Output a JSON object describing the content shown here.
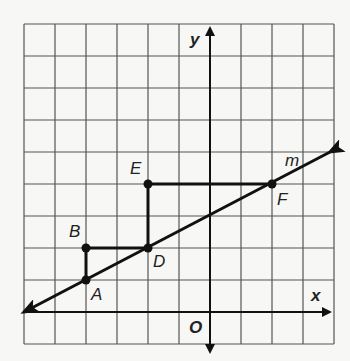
{
  "diagram": {
    "type": "coordinate-grid",
    "grid": {
      "cols": 10,
      "rows": 10,
      "origin_col": 6,
      "origin_row": 9
    },
    "axes": {
      "x_label": "x",
      "y_label": "y",
      "origin_label": "O"
    },
    "line": {
      "label": "m",
      "slope": 0.5,
      "through": [
        "A",
        "D",
        "F"
      ]
    },
    "points": [
      {
        "name": "A",
        "x": -4,
        "y": 1
      },
      {
        "name": "B",
        "x": -4,
        "y": 2
      },
      {
        "name": "D",
        "x": -2,
        "y": 2
      },
      {
        "name": "E",
        "x": -2,
        "y": 4
      },
      {
        "name": "F",
        "x": 2,
        "y": 4
      }
    ],
    "segments": [
      [
        "A",
        "B"
      ],
      [
        "B",
        "D"
      ],
      [
        "D",
        "E"
      ],
      [
        "E",
        "F"
      ]
    ],
    "colors": {
      "grid": "#555555",
      "ink": "#111111",
      "background": "#f7f7f5"
    }
  }
}
